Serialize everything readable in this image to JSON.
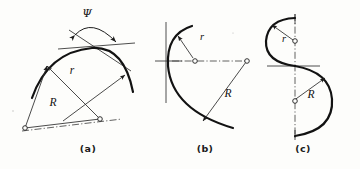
{
  "figure": {
    "name": "radius-and-angle-construction-figure",
    "background_color": "#fdfdfb",
    "ink_color": "#121212",
    "width": 360,
    "height": 169,
    "panels": [
      {
        "id": "a",
        "caption": "(a)",
        "caption_x": 88,
        "caption_y": 152,
        "description": "Convex arc with tangent line, included angle psi, two radii r from a near center and radius R from a far center on a dash-dot axis",
        "labels": [
          {
            "name": "angle-label-psi",
            "text": "Ψ",
            "x": 87,
            "y": 17
          },
          {
            "name": "radius-label-r",
            "text": "r",
            "x": 72,
            "y": 74
          },
          {
            "name": "radius-label-R",
            "text": "R",
            "x": 53,
            "y": 106
          }
        ]
      },
      {
        "id": "b",
        "caption": "(b)",
        "caption_x": 205,
        "caption_y": 152,
        "description": "Open C arc tangent to a vertical line, small radius r from a center on a horizontal dash-dot axis and large radius R from a far right center",
        "labels": [
          {
            "name": "radius-label-r",
            "text": "r",
            "x": 202,
            "y": 40
          },
          {
            "name": "radius-label-R",
            "text": "R",
            "x": 228,
            "y": 97
          }
        ]
      },
      {
        "id": "c",
        "caption": "(c)",
        "caption_x": 303,
        "caption_y": 152,
        "description": "S shaped reverse curve on a vertical dash-dot centerline, small radius r above and large radius R below, horizontal tangent at the inflection point",
        "labels": [
          {
            "name": "radius-label-r",
            "text": "r",
            "x": 284,
            "y": 40
          },
          {
            "name": "radius-label-R",
            "text": "R",
            "x": 311,
            "y": 98
          }
        ]
      }
    ]
  }
}
